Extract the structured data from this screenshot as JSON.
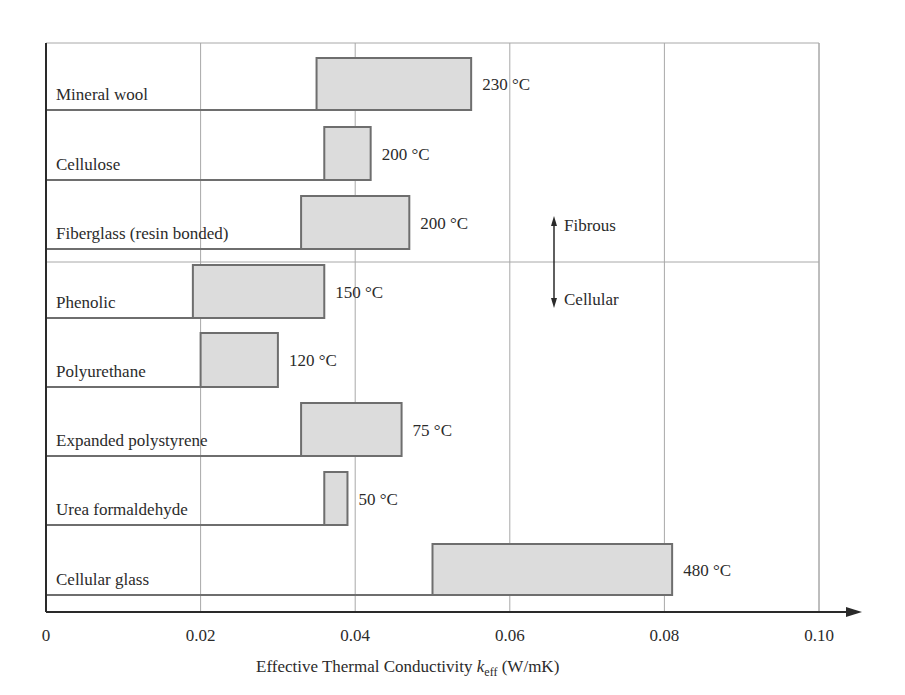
{
  "chart_data": {
    "type": "range-bar",
    "title": "",
    "xlabel": "Effective Thermal Conductivity k_eff (W/mK)",
    "xlabel_parts": {
      "prefix": "Effective Thermal Conductivity ",
      "symbol": "k",
      "subscript": "eff",
      "suffix": " (W/mK)"
    },
    "ylabel": "",
    "xlim": [
      0,
      0.1
    ],
    "x_ticks": [
      0,
      0.02,
      0.04,
      0.06,
      0.08,
      0.1
    ],
    "x_tick_labels": [
      "0",
      "0.02",
      "0.04",
      "0.06",
      "0.08",
      "0.10"
    ],
    "grid": {
      "vertical": true,
      "horizontal_row_separators": true
    },
    "categories": [
      "Mineral wool",
      "Cellulose",
      "Fiberglass (resin bonded)",
      "Phenolic",
      "Polyurethane",
      "Expanded polystyrene",
      "Urea formaldehyde",
      "Cellular glass"
    ],
    "series": [
      {
        "name": "k_eff range (W/mK)",
        "ranges": [
          [
            0.035,
            0.055
          ],
          [
            0.036,
            0.042
          ],
          [
            0.033,
            0.047
          ],
          [
            0.019,
            0.036
          ],
          [
            0.02,
            0.03
          ],
          [
            0.033,
            0.046
          ],
          [
            0.036,
            0.039
          ],
          [
            0.05,
            0.081
          ]
        ]
      },
      {
        "name": "Maximum service temperature",
        "labels": [
          "230 °C",
          "200 °C",
          "200 °C",
          "150 °C",
          "120 °C",
          "75 °C",
          "50 °C",
          "480 °C"
        ]
      }
    ],
    "groups": [
      {
        "name": "Fibrous",
        "categories": [
          "Mineral wool",
          "Cellulose",
          "Fiberglass (resin bonded)"
        ],
        "arrow": "up"
      },
      {
        "name": "Cellular",
        "categories": [
          "Phenolic",
          "Polyurethane",
          "Expanded polystyrene",
          "Urea formaldehyde",
          "Cellular glass"
        ],
        "arrow": "down"
      }
    ],
    "annotations": [
      "Fibrous",
      "Cellular"
    ],
    "colors": {
      "bar_fill": "#dcdcdc",
      "bar_edge": "#6e6e6e",
      "grid": "#a8a8a8",
      "axis": "#2a2a2a",
      "text": "#2b2b2b"
    }
  }
}
